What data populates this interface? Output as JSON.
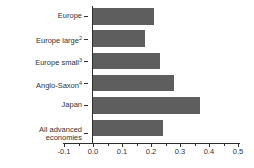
{
  "chart_data": {
    "type": "bar",
    "orientation": "horizontal",
    "title": "",
    "categories": [
      "Europe",
      "Europe large",
      "Europe small",
      "Anglo-Saxon",
      "Japan",
      "All advanced economies"
    ],
    "category_label_lines": [
      [
        "Europe"
      ],
      [
        "Europe large"
      ],
      [
        "Europe small"
      ],
      [
        "Anglo-Saxon"
      ],
      [
        "Japan"
      ],
      [
        "All advanced",
        "economies"
      ]
    ],
    "category_footnote_refs": [
      "",
      "2",
      "3",
      "4",
      "",
      ""
    ],
    "values": [
      0.21,
      0.18,
      0.23,
      0.28,
      0.37,
      0.24
    ],
    "xlim": [
      -0.1,
      0.5
    ],
    "x_tick_values": [
      -0.1,
      0.0,
      0.1,
      0.2,
      0.3,
      0.4,
      0.5
    ],
    "x_tick_labels": [
      "-0.1",
      "0.0",
      "0.1",
      "0.2",
      "0.3",
      "0.4",
      "0.5"
    ],
    "x_minor_tick_values": [
      -0.05,
      0.05,
      0.15,
      0.25,
      0.35,
      0.45
    ],
    "xlabel": "",
    "ylabel": "",
    "grid": false,
    "legend": false,
    "colors": {
      "bar": "#5e5e5e",
      "axis": "#2e2e2e",
      "text": "#333333",
      "background": "#ffffff"
    }
  }
}
